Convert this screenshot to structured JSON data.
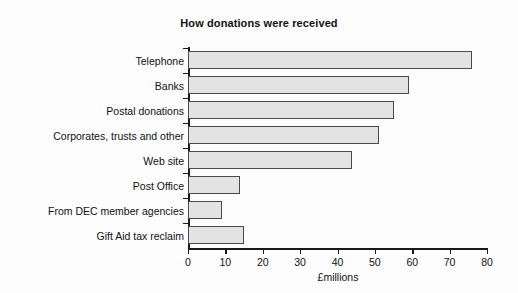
{
  "chart_data": {
    "type": "bar",
    "orientation": "horizontal",
    "title": "How donations were received",
    "xlabel": "£millions",
    "ylabel": "",
    "xlim": [
      0,
      80
    ],
    "xticks": [
      0,
      10,
      20,
      30,
      40,
      50,
      60,
      70,
      80
    ],
    "grid": false,
    "legend": null,
    "bar_fill_color": "#e3e3e3",
    "bar_edge_color": "#4a4a4a",
    "background_color": "#fdfdfd",
    "categories": [
      "Telephone",
      "Banks",
      "Postal donations",
      "Corporates, trusts and other",
      "Web site",
      "Post Office",
      "From DEC member agencies",
      "Gift Aid tax reclaim"
    ],
    "values": [
      76,
      59,
      55,
      51,
      44,
      14,
      9,
      15
    ]
  }
}
